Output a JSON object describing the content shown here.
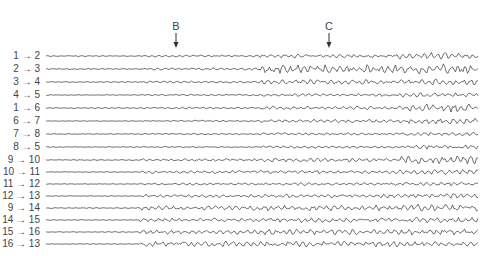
{
  "markers": [
    {
      "label": "B",
      "x": 176
    },
    {
      "label": "C",
      "x": 329
    }
  ],
  "channels": [
    {
      "label": "1 → 2",
      "y": 56,
      "amp": [
        0.5,
        1.0,
        2.0,
        4.0
      ]
    },
    {
      "label": "2 → 3",
      "y": 69,
      "amp": [
        0.6,
        1.2,
        4.5,
        5.5
      ]
    },
    {
      "label": "3 → 4",
      "y": 82,
      "amp": [
        0.5,
        1.0,
        2.5,
        3.0
      ]
    },
    {
      "label": "4 → 5",
      "y": 95,
      "amp": [
        0.4,
        0.8,
        1.5,
        2.5
      ]
    },
    {
      "label": "1 → 6",
      "y": 108,
      "amp": [
        0.5,
        1.0,
        2.0,
        4.5
      ]
    },
    {
      "label": "6 → 7",
      "y": 121,
      "amp": [
        0.4,
        0.8,
        1.8,
        3.0
      ]
    },
    {
      "label": "7 → 8",
      "y": 134,
      "amp": [
        0.4,
        0.7,
        1.2,
        2.0
      ]
    },
    {
      "label": "8 → 5",
      "y": 147,
      "amp": [
        0.4,
        0.7,
        1.2,
        2.5
      ]
    },
    {
      "label": "9 → 10",
      "y": 160,
      "amp": [
        0.5,
        1.5,
        2.0,
        4.0
      ]
    },
    {
      "label": "10 → 11",
      "y": 172,
      "amp": [
        0.4,
        1.5,
        1.8,
        2.5
      ]
    },
    {
      "label": "11 → 12",
      "y": 184,
      "amp": [
        0.4,
        1.2,
        1.5,
        2.0
      ]
    },
    {
      "label": "12 → 13",
      "y": 196,
      "amp": [
        0.4,
        1.5,
        2.0,
        2.5
      ]
    },
    {
      "label": "9 → 14",
      "y": 208,
      "amp": [
        0.5,
        2.5,
        3.0,
        4.0
      ]
    },
    {
      "label": "14 → 15",
      "y": 220,
      "amp": [
        0.4,
        2.0,
        2.5,
        3.0
      ]
    },
    {
      "label": "15 → 16",
      "y": 232,
      "amp": [
        0.4,
        2.5,
        3.0,
        3.0
      ]
    },
    {
      "label": "16 → 13",
      "y": 244,
      "amp": [
        0.4,
        3.0,
        3.0,
        2.5
      ]
    }
  ]
}
